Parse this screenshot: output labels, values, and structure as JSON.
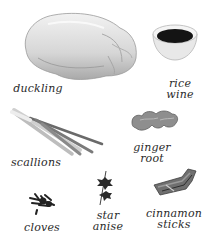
{
  "ingredients": {
    "duckling": {
      "name": "duckling",
      "icon": "duckling-icon"
    },
    "rice_wine": {
      "line1": "rice",
      "line2": "wine",
      "icon": "rice-wine-bowl-icon"
    },
    "scallions": {
      "name": "scallions",
      "icon": "scallions-icon"
    },
    "ginger_root": {
      "line1": "ginger",
      "line2": "root",
      "icon": "ginger-root-icon"
    },
    "cloves": {
      "name": "cloves",
      "icon": "cloves-icon"
    },
    "star_anise": {
      "line1": "star",
      "line2": "anise",
      "icon": "star-anise-icon"
    },
    "cinnamon_sticks": {
      "line1": "cinnamon",
      "line2": "sticks",
      "icon": "cinnamon-sticks-icon"
    }
  },
  "colors": {
    "background": "#ffffff",
    "label_text": "#2a2a2a",
    "duck_skin": "#d9d9d9",
    "wine": "#141414",
    "bowl": "#e6e6e6"
  }
}
